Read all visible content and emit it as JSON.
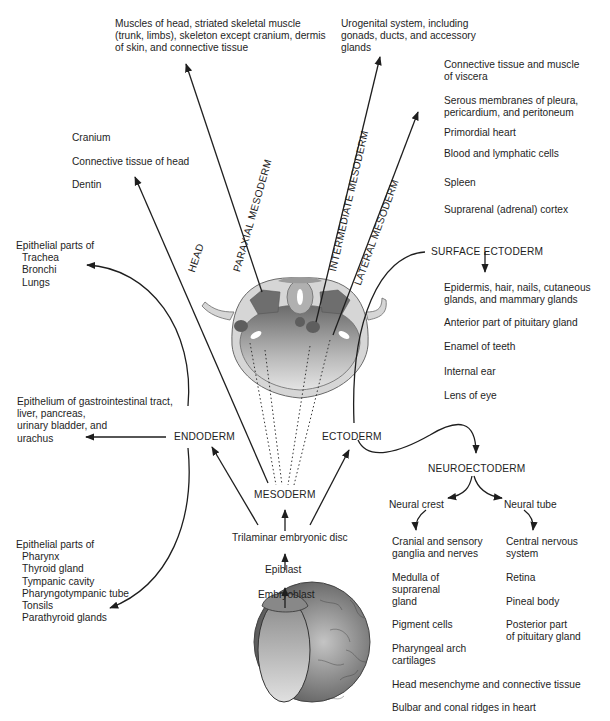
{
  "germ_layers": {
    "mesoderm": "MESODERM",
    "endoderm": "ENDODERM",
    "ectoderm": "ECTODERM",
    "surface_ectoderm": "SURFACE ECTODERM",
    "neuroectoderm": "NEUROECTODERM"
  },
  "precursors": {
    "trilaminar": "Trilaminar embryonic disc",
    "epiblast": "Epiblast",
    "embryoblast": "Embryoblast"
  },
  "mesoderm_branches": {
    "head": "HEAD",
    "paraxial": "PARAXIAL MESODERM",
    "intermediate": "INTERMEDIATE MESODERM",
    "lateral": "LATERAL MESODERM"
  },
  "derivatives": {
    "paraxial": [
      "Muscles of head, striated skeletal muscle",
      "(trunk, limbs), skeleton except cranium, dermis",
      "of skin, and  connective tissue"
    ],
    "intermediate": [
      "Urogenital system, including",
      "gonads, ducts, and accessory",
      "glands"
    ],
    "head": [
      "Cranium",
      "Connective tissue of head",
      "Dentin"
    ],
    "lateral": [
      [
        "Connective tissue and muscle",
        "of viscera"
      ],
      [
        "Serous membranes of pleura,",
        "pericardium, and peritoneum"
      ],
      [
        "Primordial heart"
      ],
      [
        "Blood and lymphatic cells"
      ],
      [
        "Spleen"
      ],
      [
        "Suprarenal (adrenal) cortex"
      ]
    ],
    "endoderm_upper": [
      "Epithelial parts of",
      "Trachea",
      "Bronchi",
      "Lungs"
    ],
    "endoderm_middle": [
      "Epithelium of gastrointestinal tract,",
      "liver, pancreas,",
      "urinary bladder, and",
      "urachus"
    ],
    "endoderm_lower": [
      "Epithelial parts of",
      "Pharynx",
      "Thyroid gland",
      "Tympanic cavity",
      "Pharyngotympanic tube",
      "Tonsils",
      "Parathyroid glands"
    ],
    "surface_ectoderm": [
      [
        "Epidermis, hair, nails, cutaneous",
        "glands, and mammary glands"
      ],
      [
        "Anterior part of pituitary gland"
      ],
      [
        "Enamel of teeth"
      ],
      [
        "Internal ear"
      ],
      [
        "Lens of eye"
      ]
    ],
    "neural_crest_label": "Neural crest",
    "neural_tube_label": "Neural tube",
    "neural_crest": [
      [
        "Cranial and sensory",
        "ganglia and nerves"
      ],
      [
        "Medulla of",
        "suprarenal",
        "gland"
      ],
      [
        "Pigment cells"
      ],
      [
        "Pharyngeal arch",
        "cartilages"
      ]
    ],
    "neural_tube": [
      [
        "Central nervous",
        "system"
      ],
      [
        "Retina"
      ],
      [
        "Pineal body"
      ],
      [
        "Posterior part",
        "of pituitary gland"
      ]
    ],
    "neural_crest_wide": [
      "Head mesenchyme and connective tissue",
      "Bulbar and conal ridges in heart"
    ]
  },
  "colors": {
    "ink": "#1e1e1e",
    "tissue_light": "#d4d4d4",
    "tissue_dark": "#7a7a7a"
  }
}
